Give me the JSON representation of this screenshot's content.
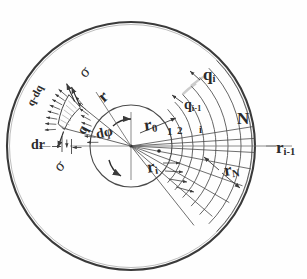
{
  "figure": {
    "kind": "engineering-diagram",
    "background_color": "#fefefe",
    "ink_color": "#2b2b2b",
    "line_color": "#555555"
  },
  "labels": {
    "sigma_top": "σ",
    "sigma_bottom": "σ",
    "q_minus_dq": "q-dq",
    "q": "q",
    "dr": "dr",
    "d_phi": "dφ",
    "r": "r",
    "r_zero": "r",
    "r_zero_sub": "0",
    "r_i": "r",
    "r_i_sub": "i",
    "r_N": "r",
    "r_N_sub": "N",
    "r_i_minus_1": "r",
    "r_i_minus_1_sub": "i-1",
    "q_i": "q",
    "q_i_sub": "i",
    "q_i_minus_1": "q",
    "q_i_minus_1_sub": "i-1",
    "ring_1": "1",
    "ring_2": "2",
    "ring_i": "i",
    "ring_N": "N"
  },
  "geometry": {
    "center_x": 131,
    "center_y": 146,
    "outer_radius": 124,
    "hub_radius": 41,
    "ring_radii": [
      52,
      62,
      73,
      85,
      97,
      110,
      121
    ],
    "element_inner_radius": 62,
    "element_outer_radius": 80
  }
}
